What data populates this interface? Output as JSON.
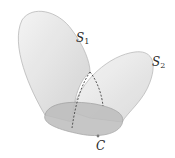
{
  "diagram": {
    "labels": {
      "s1": {
        "base": "S",
        "sub": "1"
      },
      "s2": {
        "base": "S",
        "sub": "2"
      },
      "curve": "C"
    },
    "colors": {
      "surface_fill": "#e4e4e4",
      "surface_fill_dark": "#c9c9c9",
      "base_fill": "#b9b9b9",
      "outline": "#a8a8a8",
      "dashed": "#444444",
      "text": "#2a2a2a"
    }
  }
}
